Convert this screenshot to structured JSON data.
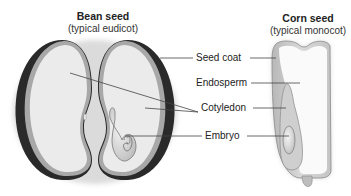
{
  "bean": {
    "title": "Bean seed",
    "subtitle": "(typical eudicot)"
  },
  "corn": {
    "title": "Corn seed",
    "subtitle": "(typical monocot)"
  },
  "labels": {
    "seed_coat": "Seed coat",
    "endosperm": "Endosperm",
    "cotyledon": "Cotyledon",
    "embryo": "Embryo"
  },
  "colors": {
    "seed_fill": "#ececec",
    "seed_coat_dark": "#2a2a2a",
    "seed_rim": "#9a9a9a",
    "embryo_fill": "#d4d4d4",
    "leader_line": "#444444"
  }
}
